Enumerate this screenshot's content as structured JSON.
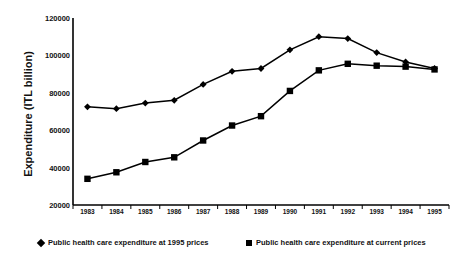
{
  "chart_data": {
    "type": "line",
    "title": "",
    "subtitle": "",
    "xlabel": "",
    "ylabel": "Expenditure (ITL billion)",
    "categories": [
      "1983",
      "1984",
      "1985",
      "1986",
      "1987",
      "1988",
      "1989",
      "1990",
      "1991",
      "1992",
      "1993",
      "1994",
      "1995"
    ],
    "x": [
      1983,
      1984,
      1985,
      1986,
      1987,
      1988,
      1989,
      1990,
      1991,
      1992,
      1993,
      1994,
      1995
    ],
    "ylim": [
      20000,
      120000
    ],
    "yticks": [
      20000,
      40000,
      60000,
      80000,
      100000,
      120000
    ],
    "ytick_labels": [
      "20000",
      "40000",
      "60000",
      "80000",
      "100000",
      "120000"
    ],
    "grid": false,
    "legend_position": "below",
    "series": [
      {
        "name": "Public health care expenditure at 1995 prices",
        "marker": "diamond",
        "color": "#000000",
        "values": [
          72500,
          71500,
          74500,
          76000,
          84500,
          91500,
          93000,
          103000,
          110000,
          109000,
          101500,
          96500,
          93000
        ]
      },
      {
        "name": "Public health care expenditure at current prices",
        "marker": "square",
        "color": "#000000",
        "values": [
          34000,
          37500,
          43000,
          45500,
          54500,
          62500,
          67500,
          81000,
          92000,
          95500,
          94500,
          94000,
          92500
        ]
      }
    ]
  },
  "axis": {
    "y_title": "Expenditure (ITL billion)"
  },
  "legend": {
    "items": [
      {
        "label": "Public health care expenditure at 1995 prices",
        "marker": "diamond-marker"
      },
      {
        "label": "Public health care expenditure at current prices",
        "marker": "square-marker"
      }
    ]
  }
}
